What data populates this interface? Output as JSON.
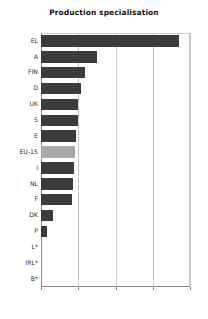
{
  "chart_data": {
    "type": "bar",
    "orientation": "horizontal",
    "title": "Production specialisation",
    "xlabel": "",
    "ylabel": "",
    "categories": [
      "EL",
      "A",
      "FIN",
      "D",
      "UK",
      "S",
      "E",
      "EU-15",
      "I",
      "NL",
      "F",
      "DK",
      "P",
      "L*",
      "IRL*",
      "B*"
    ],
    "values": [
      370,
      150,
      118,
      108,
      100,
      98,
      95,
      92,
      88,
      86,
      83,
      32,
      17,
      0,
      0,
      0
    ],
    "xlim": [
      0,
      400
    ],
    "xticks": [
      0,
      100,
      200,
      300,
      400
    ],
    "xtick_labels": [
      "0",
      "100",
      "200",
      "300",
      "400"
    ],
    "grid": true,
    "legend": null,
    "colors": {
      "bar": "#3b3b3b",
      "highlight_bar": "#a9a9a9",
      "grid": "#c9c9c9",
      "axis": "#8a8a8a",
      "text": "#2b2b2b",
      "background": "#ffffff"
    },
    "highlight_category": "EU-15"
  }
}
